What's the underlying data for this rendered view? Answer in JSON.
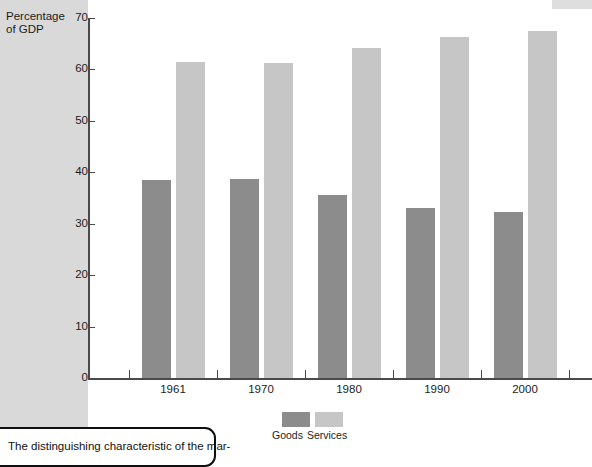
{
  "chart_data": {
    "type": "bar",
    "title": "",
    "xlabel": "",
    "ylabel": "Percentage of GDP",
    "ylabel_line1": "Percentage",
    "ylabel_line2": "of GDP",
    "categories": [
      "1961",
      "1970",
      "1980",
      "1990",
      "2000"
    ],
    "series": [
      {
        "name": "Goods",
        "color": "#8c8c8c",
        "values": [
          38.5,
          38.7,
          35.6,
          33.0,
          32.2
        ]
      },
      {
        "name": "Services",
        "color": "#c6c6c6",
        "values": [
          61.4,
          61.2,
          64.2,
          66.3,
          67.4
        ]
      }
    ],
    "ylim": [
      0,
      70
    ],
    "ytick_labels": [
      "0",
      "10",
      "20",
      "30",
      "40",
      "50",
      "60",
      "70"
    ],
    "ytick_values": [
      0,
      10,
      20,
      30,
      40,
      50,
      60,
      70
    ],
    "grid": false,
    "legend_position": "bottom-center"
  },
  "legend": {
    "entries": [
      {
        "label": "Goods",
        "color": "#8c8c8c"
      },
      {
        "label": "Services",
        "color": "#c6c6c6"
      }
    ]
  },
  "caption": {
    "text": "The distinguishing characteristic of the mar-"
  },
  "colors": {
    "goods": "#8c8c8c",
    "services": "#c6c6c6",
    "axis": "#4a4a4a",
    "page_band": "#d9d9d9",
    "plot_background": "#ffffff",
    "text": "#1c1c1c"
  }
}
